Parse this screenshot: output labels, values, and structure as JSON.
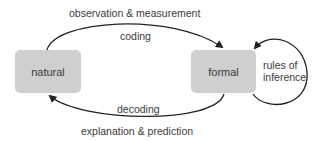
{
  "nodes": {
    "natural": {
      "label": "natural"
    },
    "formal": {
      "label": "formal"
    }
  },
  "edges": {
    "top_outer": {
      "label": "observation & measurement"
    },
    "top_inner": {
      "label": "coding"
    },
    "bottom_inner": {
      "label": "decoding"
    },
    "bottom_outer": {
      "label": "explanation & prediction"
    },
    "self_loop": {
      "line1": "rules of",
      "line2": "inference"
    }
  },
  "colors": {
    "box_fill": "#cfcfcf",
    "line": "#222222",
    "text": "#3a3a3a"
  }
}
